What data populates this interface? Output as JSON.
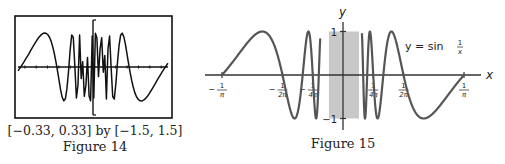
{
  "figure14": {
    "caption_range": "[−0.33, 0.33] by [−1.5, 1.5]",
    "caption_title": "Figure 14",
    "window": {
      "xmin": -0.33,
      "xmax": 0.33,
      "ymin": -1.5,
      "ymax": 1.5
    },
    "function": "sin(1/x)",
    "samples": 95
  },
  "figure15": {
    "caption_title": "Figure 15",
    "axis_x_label": "x",
    "axis_y_label": "y",
    "curve_label_prefix": "y = sin",
    "curve_label_frac_num": "1",
    "curve_label_frac_den": "x",
    "y_ticks": [
      {
        "value": 1,
        "label": "1"
      },
      {
        "value": -1,
        "label": "−1"
      }
    ],
    "x_ticks": [
      {
        "value": -0.3183,
        "num": "1",
        "den": "π",
        "sign": "−"
      },
      {
        "value": -0.1592,
        "num": "1",
        "den": "2π",
        "sign": "−"
      },
      {
        "value": -0.0796,
        "num": "1",
        "den": "4π",
        "sign": "−"
      },
      {
        "value": 0.0796,
        "num": "1",
        "den": "4π",
        "sign": ""
      },
      {
        "value": 0.1592,
        "num": "1",
        "den": "2π",
        "sign": ""
      },
      {
        "value": 0.3183,
        "num": "1",
        "den": "π",
        "sign": ""
      }
    ],
    "shaded_region": {
      "xmin": -0.037,
      "xmax": 0.042,
      "color": "#c8c8c8"
    },
    "curve_domain_inner": 0.06
  },
  "chart_data": [
    {
      "type": "line",
      "title": "Figure 14",
      "subtitle": "[−0.33, 0.33] by [−1.5, 1.5]",
      "series": [
        {
          "name": "y = sin(1/x) (calculator plot, aliased)",
          "function": "sin(1/x)"
        }
      ],
      "xlim": [
        -0.33,
        0.33
      ],
      "ylim": [
        -1.5,
        1.5
      ],
      "xlabel": "",
      "ylabel": "",
      "grid": false
    },
    {
      "type": "line",
      "title": "Figure 15",
      "series": [
        {
          "name": "y = sin 1/x",
          "function": "sin(1/x)"
        }
      ],
      "x_tick_labels": [
        "−1/π",
        "−1/2π",
        "−1/4π",
        "1/4π",
        "1/2π",
        "1/π"
      ],
      "y_tick_labels": [
        "1",
        "−1"
      ],
      "xlabel": "x",
      "ylabel": "y",
      "xlim": [
        -0.3183,
        0.3183
      ],
      "ylim": [
        -1,
        1
      ],
      "annotations": [
        "y = sin 1/x",
        "shaded band near x = 0"
      ],
      "grid": false
    }
  ]
}
